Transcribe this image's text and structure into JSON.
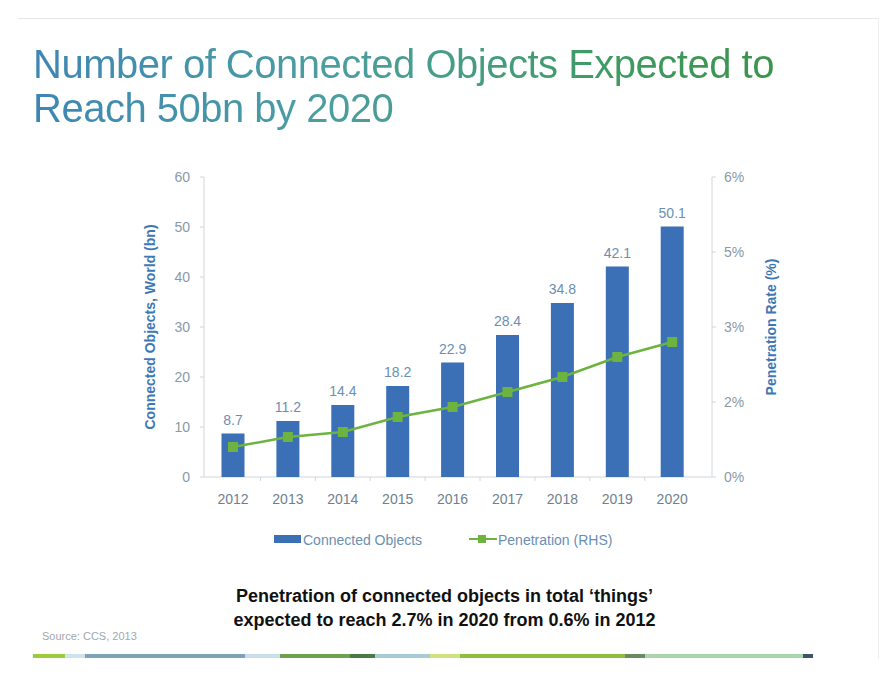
{
  "title": {
    "line1": "Number of Connected Objects Expected to",
    "line2": "Reach 50bn by 2020"
  },
  "chart_data": {
    "type": "bar",
    "title": "Number of Connected Objects Expected to Reach 50bn by 2020",
    "categories": [
      "2012",
      "2013",
      "2014",
      "2015",
      "2016",
      "2017",
      "2018",
      "2019",
      "2020"
    ],
    "series": [
      {
        "name": "Connected Objects",
        "type": "bar",
        "axis": "left",
        "color": "#3b6fb6",
        "values": [
          8.7,
          11.2,
          14.4,
          18.2,
          22.9,
          28.4,
          34.8,
          42.1,
          50.1
        ],
        "labels": [
          "8.7",
          "11.2",
          "14.4",
          "18.2",
          "22.9",
          "28.4",
          "34.8",
          "42.1",
          "50.1"
        ]
      },
      {
        "name": "Penetration (RHS)",
        "type": "line",
        "axis": "right",
        "color": "#6db33f",
        "marker": "square",
        "values": [
          0.6,
          0.8,
          0.9,
          1.2,
          1.4,
          1.7,
          2.0,
          2.4,
          2.7
        ]
      }
    ],
    "ylabel": "Connected Objects, World (bn)",
    "y2label": "Penetration Rate (%)",
    "ylim": [
      0,
      60
    ],
    "y2lim": [
      0,
      6
    ],
    "yticks": [
      "0",
      "10",
      "20",
      "30",
      "40",
      "50",
      "60"
    ],
    "y2ticks": [
      "0%",
      "2%",
      "3%",
      "5%",
      "6%"
    ],
    "grid": false,
    "legend_position": "bottom"
  },
  "legend": {
    "bars": "Connected Objects",
    "line": "Penetration (RHS)"
  },
  "caption": {
    "line1": "Penetration of connected objects in total ‘things’",
    "line2": "expected to reach 2.7% in 2020 from 0.6% in 2012"
  },
  "source": "Source: CCS, 2013",
  "colors": {
    "bar": "#3b6fb6",
    "line": "#6db33f",
    "axis_title": "#3d78b5"
  }
}
